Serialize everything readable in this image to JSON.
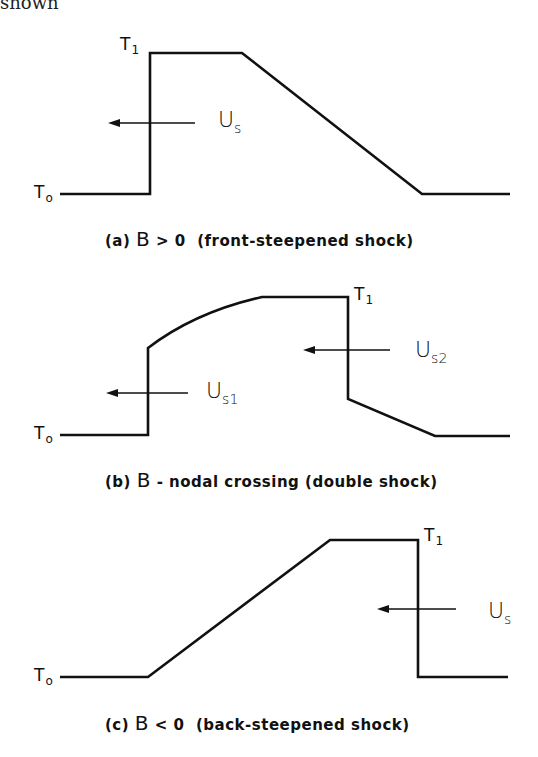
{
  "header_fragment": "shown",
  "panels": [
    {
      "id": "a",
      "caption": {
        "prefix": "(a)",
        "symbol": "B",
        "relation": "> 0",
        "description": "(front-steepened shock)"
      },
      "labels": {
        "t_high": "T",
        "t_high_sub": "1",
        "t_low": "T",
        "t_low_sub": "o"
      },
      "velocities": [
        {
          "text": "U",
          "sub": "s",
          "direction": "left"
        }
      ]
    },
    {
      "id": "b",
      "caption": {
        "prefix": "(b)",
        "symbol": "B",
        "relation": "",
        "description": "- nodal crossing (double shock)"
      },
      "labels": {
        "t_high": "T",
        "t_high_sub": "1",
        "t_low": "T",
        "t_low_sub": "o"
      },
      "velocities": [
        {
          "text": "U",
          "sub": "s1",
          "direction": "left"
        },
        {
          "text": "U",
          "sub": "s2",
          "direction": "left"
        }
      ]
    },
    {
      "id": "c",
      "caption": {
        "prefix": "(c)",
        "symbol": "B",
        "relation": "< 0",
        "description": "(back-steepened shock)"
      },
      "labels": {
        "t_high": "T",
        "t_high_sub": "1",
        "t_low": "T",
        "t_low_sub": "o"
      },
      "velocities": [
        {
          "text": "U",
          "sub": "s",
          "direction": "left"
        }
      ]
    }
  ],
  "colors": {
    "ink": "#111111",
    "background": "#ffffff"
  }
}
